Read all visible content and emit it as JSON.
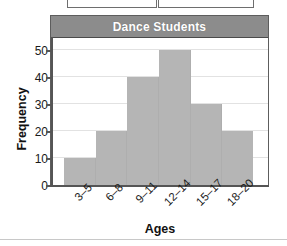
{
  "chart_data": {
    "type": "bar",
    "title": "Dance Students",
    "xlabel": "Ages",
    "ylabel": "Frequency",
    "categories": [
      "3–5",
      "6–8",
      "9–11",
      "12–14",
      "15–17",
      "18–20"
    ],
    "values": [
      10,
      20,
      40,
      50,
      30,
      20
    ],
    "yticks": [
      0,
      10,
      20,
      30,
      40,
      50
    ],
    "ylim": [
      0,
      55
    ],
    "grid": true,
    "legend": null,
    "bar_color": "#b5b5b5",
    "title_bar_color": "#8c8c8c",
    "title_text_color": "#ffffff"
  },
  "top_crop": {
    "left_box_label": "",
    "right_box_label": ""
  }
}
